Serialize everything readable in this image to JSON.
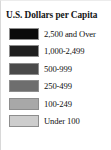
{
  "legend": {
    "title": "U.S. Dollars per Capita",
    "entries": [
      {
        "label": "2,500 and Over",
        "color": "#0b0b0b"
      },
      {
        "label": "1,000-2,499",
        "color": "#1f1f1f"
      },
      {
        "label": "500-999",
        "color": "#4a4a4a"
      },
      {
        "label": "250-499",
        "color": "#6e6e6e"
      },
      {
        "label": "100-249",
        "color": "#a8a8a8"
      },
      {
        "label": "Under 100",
        "color": "#cdcdcd"
      }
    ]
  },
  "chart_data": {
    "type": "table",
    "title": "U.S. Dollars per Capita",
    "xlabel": "",
    "ylabel": "",
    "categories": [
      "2,500 and Over",
      "1,000-2,499",
      "500-999",
      "250-499",
      "100-249",
      "Under 100"
    ],
    "values": [
      {
        "class": "2,500 and Over",
        "min": 2500,
        "max": null,
        "swatch": "#0b0b0b"
      },
      {
        "class": "1,000-2,499",
        "min": 1000,
        "max": 2499,
        "swatch": "#1f1f1f"
      },
      {
        "class": "500-999",
        "min": 500,
        "max": 999,
        "swatch": "#4a4a4a"
      },
      {
        "class": "250-499",
        "min": 250,
        "max": 499,
        "swatch": "#6e6e6e"
      },
      {
        "class": "100-249",
        "min": 100,
        "max": 249,
        "swatch": "#a8a8a8"
      },
      {
        "class": "Under 100",
        "min": null,
        "max": 99,
        "swatch": "#cdcdcd"
      }
    ],
    "legend_position": "standalone",
    "grid": false,
    "unit": "U.S. Dollars per Capita",
    "scale": "sequential-grayscale"
  }
}
